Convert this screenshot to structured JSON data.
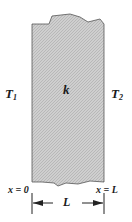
{
  "diagram": {
    "type": "plane-wall-conduction",
    "slab": {
      "fill_color": "#c8c8c8",
      "edge_color": "#555555",
      "label": "k"
    },
    "left_temperature": {
      "symbol": "T",
      "subscript": "1"
    },
    "right_temperature": {
      "symbol": "T",
      "subscript": "2"
    },
    "left_boundary_label": "x = 0",
    "right_boundary_label": "x = L",
    "dimension": {
      "label": "L"
    }
  }
}
